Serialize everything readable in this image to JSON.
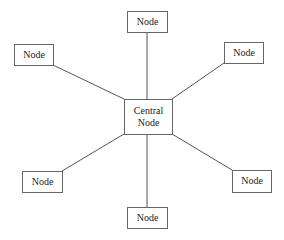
{
  "diagram": {
    "type": "star-topology",
    "central": {
      "id": "center",
      "lines": [
        "Central",
        "Node"
      ],
      "x": 124,
      "y": 99,
      "w": 48,
      "h": 35
    },
    "nodes": [
      {
        "id": "top",
        "label": "Node",
        "x": 127,
        "y": 11,
        "w": 40,
        "h": 21
      },
      {
        "id": "top-left",
        "label": "Node",
        "x": 14,
        "y": 44,
        "w": 39,
        "h": 21
      },
      {
        "id": "top-right",
        "label": "Node",
        "x": 224,
        "y": 42,
        "w": 39,
        "h": 21
      },
      {
        "id": "bottom-left",
        "label": "Node",
        "x": 22,
        "y": 171,
        "w": 40,
        "h": 21
      },
      {
        "id": "bottom-right",
        "label": "Node",
        "x": 232,
        "y": 170,
        "w": 39,
        "h": 22
      },
      {
        "id": "bottom",
        "label": "Node",
        "x": 127,
        "y": 207,
        "w": 40,
        "h": 21
      }
    ],
    "edges": [
      {
        "from": "center",
        "to": "top",
        "x1": 147,
        "y1": 99,
        "x2": 147,
        "y2": 32
      },
      {
        "from": "center",
        "to": "top-left",
        "x1": 124,
        "y1": 99,
        "x2": 53,
        "y2": 65
      },
      {
        "from": "center",
        "to": "top-right",
        "x1": 172,
        "y1": 99,
        "x2": 224,
        "y2": 63
      },
      {
        "from": "center",
        "to": "bottom-left",
        "x1": 124,
        "y1": 134,
        "x2": 62,
        "y2": 171
      },
      {
        "from": "center",
        "to": "bottom-right",
        "x1": 172,
        "y1": 134,
        "x2": 232,
        "y2": 170
      },
      {
        "from": "center",
        "to": "bottom",
        "x1": 147,
        "y1": 134,
        "x2": 147,
        "y2": 207
      }
    ]
  }
}
